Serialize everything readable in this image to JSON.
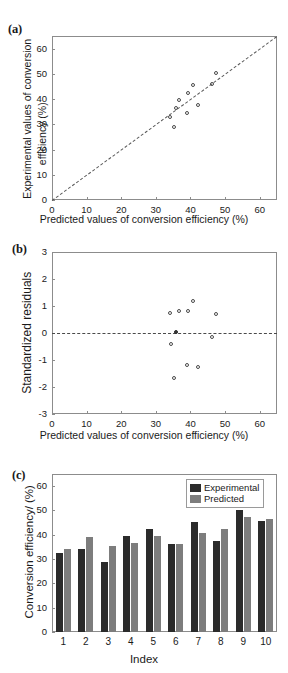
{
  "figure": {
    "panels": [
      "(a)",
      "(b)",
      "(c)"
    ]
  },
  "panel_a": {
    "tag": "(a)",
    "xlabel": "Predicted values of conversion efficiency (%)",
    "ylabel_line1": "Experimental values of conversion",
    "ylabel_line2": "efficiency (%)",
    "xticks": [
      "0",
      "10",
      "20",
      "30",
      "40",
      "50",
      "60"
    ],
    "yticks": [
      "0",
      "10",
      "20",
      "30",
      "40",
      "50",
      "60"
    ]
  },
  "panel_b": {
    "tag": "(b)",
    "xlabel": "Predicted values of conversion efficiency (%)",
    "ylabel": "Standardized residuals",
    "xticks": [
      "0",
      "10",
      "20",
      "30",
      "40",
      "50",
      "60"
    ],
    "yticks": [
      "3",
      "2",
      "1",
      "0",
      "-1",
      "-2",
      "-3"
    ]
  },
  "panel_c": {
    "tag": "(c)",
    "xlabel": "Index",
    "ylabel": "Conversion efficiency/ (%)",
    "yticks": [
      "60",
      "50",
      "40",
      "30",
      "20",
      "10",
      "0"
    ],
    "legend": [
      {
        "label": "Experimental",
        "color": "#2b2b2b"
      },
      {
        "label": "Predicted",
        "color": "#7d7d7d"
      }
    ]
  },
  "chart_data": [
    {
      "type": "scatter",
      "panel": "(a)",
      "title": "",
      "xlabel": "Predicted values of conversion efficiency (%)",
      "ylabel": "Experimental values of conversion efficiency (%)",
      "xlim": [
        0,
        65
      ],
      "ylim": [
        0,
        65
      ],
      "xticks": [
        0,
        10,
        20,
        30,
        40,
        50,
        60
      ],
      "yticks": [
        0,
        10,
        20,
        30,
        40,
        50,
        60
      ],
      "grid": false,
      "reference_line": {
        "type": "identity",
        "style": "dashed",
        "from": [
          0,
          0
        ],
        "to": [
          65,
          65
        ]
      },
      "points": [
        {
          "x": 34.3,
          "y": 32.7
        },
        {
          "x": 39.0,
          "y": 34.3
        },
        {
          "x": 35.4,
          "y": 28.7
        },
        {
          "x": 36.7,
          "y": 39.5
        },
        {
          "x": 39.5,
          "y": 42.4
        },
        {
          "x": 36.0,
          "y": 36.1
        },
        {
          "x": 40.8,
          "y": 45.2
        },
        {
          "x": 42.2,
          "y": 37.4
        },
        {
          "x": 47.5,
          "y": 50.2
        },
        {
          "x": 46.5,
          "y": 45.7
        }
      ]
    },
    {
      "type": "scatter",
      "panel": "(b)",
      "title": "",
      "xlabel": "Predicted values of conversion efficiency (%)",
      "ylabel": "Standardized residuals",
      "xlim": [
        0,
        65
      ],
      "ylim": [
        -3,
        3
      ],
      "xticks": [
        0,
        10,
        20,
        30,
        40,
        50,
        60
      ],
      "yticks": [
        -3,
        -2,
        -1,
        0,
        1,
        2,
        3
      ],
      "grid": false,
      "reference_line": {
        "type": "horizontal",
        "style": "dash-dot",
        "y": 0
      },
      "points": [
        {
          "x": 34.3,
          "y": 0.74
        },
        {
          "x": 39.0,
          "y": -1.19
        },
        {
          "x": 35.4,
          "y": -1.67
        },
        {
          "x": 36.7,
          "y": 0.78
        },
        {
          "x": 39.5,
          "y": 0.78
        },
        {
          "x": 36.0,
          "y": 0.02
        },
        {
          "x": 40.8,
          "y": 1.15
        },
        {
          "x": 42.2,
          "y": -1.27
        },
        {
          "x": 47.5,
          "y": 0.68
        },
        {
          "x": 46.5,
          "y": -0.17
        },
        {
          "x": 34.6,
          "y": -0.42
        }
      ]
    },
    {
      "type": "bar",
      "panel": "(c)",
      "title": "",
      "xlabel": "Index",
      "ylabel": "Conversion efficiency/ (%)",
      "categories": [
        "1",
        "2",
        "3",
        "4",
        "5",
        "6",
        "7",
        "8",
        "9",
        "10"
      ],
      "ylim": [
        0,
        65
      ],
      "yticks": [
        0,
        10,
        20,
        30,
        40,
        50,
        60
      ],
      "grid": false,
      "legend_position": "top-right",
      "series": [
        {
          "name": "Experimental",
          "color": "#2b2b2b",
          "values": [
            32.7,
            34.3,
            28.7,
            39.5,
            42.4,
            36.1,
            45.2,
            37.4,
            50.2,
            45.7
          ]
        },
        {
          "name": "Predicted",
          "color": "#7d7d7d",
          "values": [
            34.3,
            39.0,
            35.4,
            36.7,
            39.5,
            36.0,
            40.8,
            42.2,
            47.5,
            46.5
          ]
        }
      ]
    }
  ]
}
